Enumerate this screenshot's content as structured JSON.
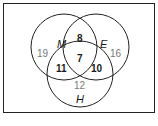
{
  "diagram": {
    "type": "venn",
    "colors": {
      "stroke": "#222222",
      "outer_numbers": "#7a7a7a",
      "inner_numbers": "#1a1a1a",
      "background": "#ffffff"
    },
    "sets": [
      {
        "id": "M",
        "label": "M"
      },
      {
        "id": "E",
        "label": "E"
      },
      {
        "id": "H",
        "label": "H"
      }
    ],
    "regions": {
      "M_only": "19",
      "E_only": "16",
      "H_only": "12",
      "M_and_E_only": "8",
      "M_and_H_only": "11",
      "E_and_H_only": "10",
      "M_and_E_and_H": "7"
    }
  }
}
